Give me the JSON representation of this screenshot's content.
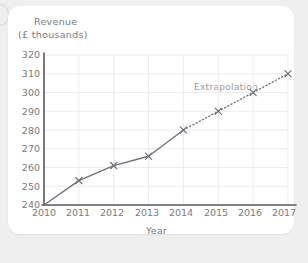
{
  "card": {
    "background": "#ffffff",
    "page_background": "#efefef"
  },
  "chart_data": {
    "type": "line",
    "title": "",
    "ylabel_line1": "Revenue",
    "ylabel_line2": "(£ thousands)",
    "xlabel": "Year",
    "categories": [
      "2010",
      "2011",
      "2012",
      "2013",
      "2014",
      "2015",
      "2016",
      "2017"
    ],
    "x": [
      2010,
      2011,
      2012,
      2013,
      2014,
      2015,
      2016,
      2017
    ],
    "series": [
      {
        "name": "Revenue",
        "style": "solid",
        "x": [
          2010,
          2011,
          2012,
          2013,
          2014
        ],
        "values": [
          240,
          253,
          261,
          266,
          280
        ]
      },
      {
        "name": "Extrapolation",
        "style": "dotted",
        "x": [
          2014,
          2015,
          2016,
          2017
        ],
        "values": [
          280,
          290,
          300,
          310
        ]
      }
    ],
    "annotations": [
      {
        "text": "Extrapolation",
        "x": 2015.2,
        "y": 303
      }
    ],
    "marker": "x-cross",
    "ylim": [
      240,
      320
    ],
    "ytick_step": 10,
    "yticks": [
      "320",
      "310",
      "300",
      "290",
      "280",
      "270",
      "260",
      "250",
      "240"
    ],
    "ytick_values": [
      320,
      310,
      300,
      290,
      280,
      270,
      260,
      250,
      240
    ],
    "xlim": [
      2010,
      2017
    ],
    "xticks": [
      "2010",
      "2011",
      "2012",
      "2013",
      "2014",
      "2015",
      "2016",
      "2017"
    ],
    "grid": true,
    "legend": "none",
    "line_color": "#6f6f76",
    "grid_color": "#ececf0",
    "axis_color": "#5a5a60",
    "text_color": "#7a7a80"
  }
}
